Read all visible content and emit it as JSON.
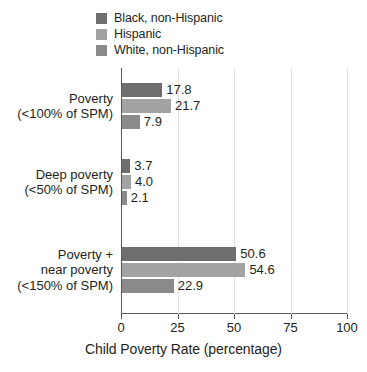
{
  "chart_data": {
    "type": "bar",
    "orientation": "horizontal",
    "title": "",
    "xlabel": "Child Poverty Rate (percentage)",
    "ylabel": "",
    "xlim": [
      0,
      100
    ],
    "xticks": [
      0,
      25,
      50,
      75,
      100
    ],
    "xtick_labels": [
      "0",
      "25",
      "50",
      "75",
      "100"
    ],
    "grid": true,
    "grid_axis": "x",
    "legend_position": "top-left",
    "categories": [
      "Poverty\n(<100% of SPM)",
      "Deep poverty\n(<50% of SPM)",
      "Poverty +\nnear poverty\n(<150% of SPM)"
    ],
    "category_lines": [
      [
        "Poverty",
        "(<100% of SPM)"
      ],
      [
        "Deep poverty",
        "(<50% of SPM)"
      ],
      [
        "Poverty +",
        "near poverty",
        "(<150% of SPM)"
      ]
    ],
    "series": [
      {
        "name": "Black, non-Hispanic",
        "color": "#6e6e6e",
        "values": [
          17.8,
          3.7,
          50.6
        ],
        "labels": [
          "17.8",
          "3.7",
          "50.6"
        ]
      },
      {
        "name": "Hispanic",
        "color": "#a3a3a3",
        "values": [
          21.7,
          4.0,
          54.6
        ],
        "labels": [
          "21.7",
          "4.0",
          "54.6"
        ]
      },
      {
        "name": "White, non-Hispanic",
        "color": "#8a8a8a",
        "values": [
          7.9,
          2.1,
          22.9
        ],
        "labels": [
          "7.9",
          "2.1",
          "22.9"
        ]
      }
    ]
  },
  "legend": {
    "items": [
      {
        "label": "Black, non-Hispanic",
        "color": "#6e6e6e"
      },
      {
        "label": "Hispanic",
        "color": "#a3a3a3"
      },
      {
        "label": "White, non-Hispanic",
        "color": "#8a8a8a"
      }
    ]
  },
  "axis": {
    "x_title": "Child Poverty Rate (percentage)",
    "tick_labels": [
      "0",
      "25",
      "50",
      "75",
      "100"
    ]
  },
  "colors": {
    "axis": "#58585a",
    "grid": "#e2e2e2",
    "text": "#231f20",
    "background": "#ffffff"
  }
}
